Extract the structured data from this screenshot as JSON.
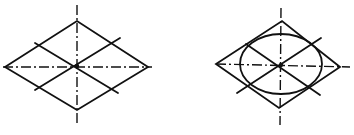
{
  "diagram": {
    "colors": {
      "line": "#111111",
      "background": "#ffffff"
    },
    "figures": [
      {
        "id": "rhombus-construction",
        "rhombus": [
          [
            5,
            67
          ],
          [
            77,
            21
          ],
          [
            148,
            67
          ],
          [
            77,
            110
          ]
        ],
        "center": [
          77,
          66
        ],
        "centerline_h": [
          [
            3,
            67
          ],
          [
            152,
            67
          ]
        ],
        "centerline_v": [
          [
            77,
            5
          ],
          [
            77,
            125
          ]
        ],
        "diagonals": [
          [
            [
              35,
              90
            ],
            [
              120,
              38
            ]
          ],
          [
            [
              35,
              43
            ],
            [
              118,
              93
            ]
          ]
        ]
      },
      {
        "id": "ellipse-inscribed",
        "rhombus": [
          [
            216,
            64
          ],
          [
            282,
            21
          ],
          [
            340,
            67
          ],
          [
            279,
            108
          ]
        ],
        "center": [
          281,
          65
        ],
        "centerline_h": [
          [
            216,
            64
          ],
          [
            350,
            67
          ]
        ],
        "centerline_v": [
          [
            281,
            8
          ],
          [
            280,
            125
          ]
        ],
        "diagonals": [
          [
            [
              237,
              93
            ],
            [
              321,
              38
            ]
          ],
          [
            [
              246,
              44
            ],
            [
              320,
              95
            ]
          ]
        ],
        "ellipse": {
          "cx": 281,
          "cy": 64,
          "rx": 41,
          "ry": 30
        }
      }
    ]
  }
}
